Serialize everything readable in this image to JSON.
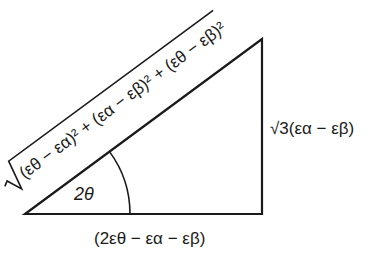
{
  "diagram": {
    "type": "right-triangle",
    "angle_label": "2θ",
    "hypotenuse_label": {
      "radical": "√",
      "expr": "(εθ − εα)² + (εα − εβ)² + (εθ − εβ)²"
    },
    "opposite_label": "√3(εα − εβ)",
    "adjacent_label": "(2εθ − εα − εβ)",
    "line_color": "#1a1a1a",
    "background": "#ffffff"
  }
}
